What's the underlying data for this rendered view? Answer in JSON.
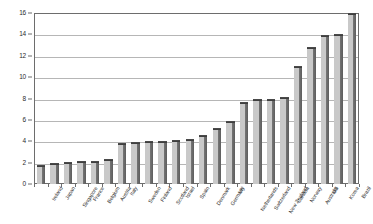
{
  "chart_data": {
    "type": "bar",
    "title": "",
    "subtitle": "",
    "xlabel": "",
    "ylabel": "",
    "ylim": [
      0,
      16
    ],
    "ytick_values": [
      0,
      2,
      4,
      6,
      8,
      10,
      12,
      14,
      16
    ],
    "ytick_labels": [
      "0",
      "2",
      "4",
      "6",
      "8",
      "10",
      "12",
      "14",
      "16"
    ],
    "grid": true,
    "legend": null,
    "legend_position": "none",
    "bar_color": "#c9c9c9",
    "bar_edge_color": "#5d5d5d",
    "gridline_color": "#b6b6b6",
    "axis_color": "#6d6d6d",
    "categories": [
      "Ireland",
      "Japan",
      "Singapore",
      "France",
      "Belgium",
      "Austria",
      "Italy",
      "Sweden",
      "Finland",
      "Scotland",
      "Israel",
      "Spain",
      "Denmark",
      "Germany",
      "UK",
      "Netherlands",
      "Switzerland",
      "New Zealand",
      "Canada",
      "Norway",
      "Australia",
      "US",
      "Korea",
      "Brazil"
    ],
    "values": [
      1.8,
      2.0,
      2.1,
      2.2,
      2.2,
      2.3,
      3.8,
      3.9,
      4.0,
      4.0,
      4.1,
      4.2,
      4.6,
      5.2,
      5.9,
      7.7,
      8.0,
      8.0,
      8.1,
      11.0,
      12.8,
      13.9,
      14.0,
      16.0
    ]
  }
}
